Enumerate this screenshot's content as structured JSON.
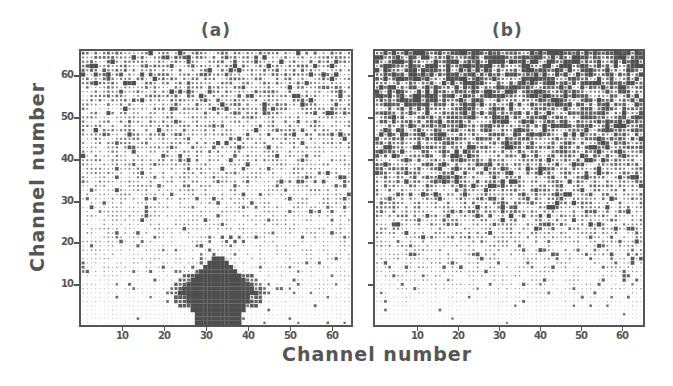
{
  "figure": {
    "xlabel": "Channel number",
    "ylabel": "Channel number"
  },
  "chart_data": [
    {
      "type": "heatmap",
      "title": "(a)",
      "xlabel": "Channel number",
      "ylabel": "Channel number",
      "xlim": [
        0,
        64
      ],
      "ylim": [
        0,
        64
      ],
      "x_ticks": [
        10,
        20,
        30,
        40,
        50,
        60
      ],
      "y_ticks": [
        10,
        20,
        30,
        40,
        50,
        60
      ],
      "grid_size": [
        64,
        64
      ],
      "description": "Dot-matrix intensity map: moderate random noise in upper rows fading toward the bottom; dense dark blob centered at channel ~32, spanning rows 0-15 (widest ~channels 25-40 around rows 5-9).",
      "features": {
        "background_density_top": 0.55,
        "background_density_bottom": 0.12,
        "blob": {
          "center_x": 32,
          "top_row": 15,
          "max_half_width": 8,
          "widest_row": 7,
          "base_half_width": 5
        }
      }
    },
    {
      "type": "heatmap",
      "title": "(b)",
      "xlabel": "Channel number",
      "ylabel": "",
      "xlim": [
        0,
        64
      ],
      "ylim": [
        0,
        64
      ],
      "x_ticks": [
        10,
        20,
        30,
        40,
        50,
        60
      ],
      "y_ticks": [
        10,
        20,
        30,
        40,
        50,
        60
      ],
      "grid_size": [
        64,
        64
      ],
      "description": "Dot-matrix intensity map: dense dark high-intensity noise across upper rows (~30-64), gradually fading to sparse/light toward rows 0-5; no localized blob.",
      "features": {
        "background_density_top": 0.9,
        "background_density_bottom": 0.08
      }
    }
  ],
  "panels": [
    {
      "title": "(a)",
      "tick_labels_x": [
        "10",
        "20",
        "30",
        "40",
        "50",
        "60"
      ],
      "tick_labels_y": [
        "60",
        "50",
        "40",
        "30",
        "20",
        "10"
      ]
    },
    {
      "title": "(b)",
      "tick_labels_x": [
        "10",
        "20",
        "30",
        "40",
        "50",
        "60"
      ],
      "tick_labels_y": []
    }
  ],
  "colors": {
    "ink": "#4e4e4e",
    "frame": "#555555",
    "background": "#ffffff"
  }
}
